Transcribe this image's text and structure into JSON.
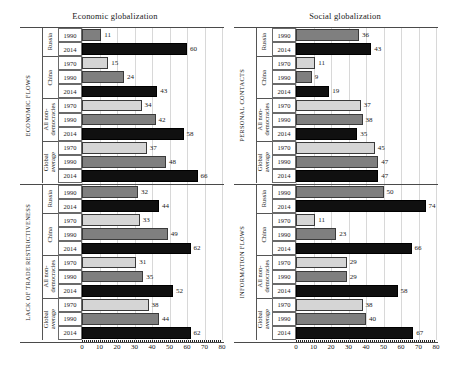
{
  "figure": {
    "width": 460,
    "height": 369,
    "colors": {
      "series_1970": "#d5d5d5",
      "series_1990": "#7f7f7f",
      "series_2014": "#101010",
      "gridline": "#d8d8d8",
      "axis": "#4a4a4a",
      "text": "#1a1a1a"
    }
  },
  "panels": [
    {
      "id": "economic",
      "title": "Economic globalization",
      "axis": {
        "min": 0,
        "max": 80,
        "ticks": [
          "0",
          "10",
          "20",
          "30",
          "40",
          "50",
          "60",
          "70",
          "80"
        ]
      },
      "sections": [
        {
          "label": "ECONOMIC FLOWS",
          "groups": [
            {
              "label": "Russia",
              "rows": [
                {
                  "year": "1990",
                  "series": "s1990",
                  "value": 11
                },
                {
                  "year": "2014",
                  "series": "s2014",
                  "value": 60
                }
              ]
            },
            {
              "label": "China",
              "rows": [
                {
                  "year": "1970",
                  "series": "s1970",
                  "value": 15
                },
                {
                  "year": "1990",
                  "series": "s1990",
                  "value": 24
                },
                {
                  "year": "2014",
                  "series": "s2014",
                  "value": 43
                }
              ]
            },
            {
              "label": "All non-\ndemocracies",
              "rows": [
                {
                  "year": "1970",
                  "series": "s1970",
                  "value": 34
                },
                {
                  "year": "1990",
                  "series": "s1990",
                  "value": 42
                },
                {
                  "year": "2014",
                  "series": "s2014",
                  "value": 58
                }
              ]
            },
            {
              "label": "Global\naverage",
              "rows": [
                {
                  "year": "1970",
                  "series": "s1970",
                  "value": 37
                },
                {
                  "year": "1990",
                  "series": "s1990",
                  "value": 48
                },
                {
                  "year": "2014",
                  "series": "s2014",
                  "value": 66
                }
              ]
            }
          ]
        },
        {
          "label": "LACK OF TRADE RESTRICTIVENESS",
          "groups": [
            {
              "label": "Russia",
              "rows": [
                {
                  "year": "1990",
                  "series": "s1990",
                  "value": 32
                },
                {
                  "year": "2014",
                  "series": "s2014",
                  "value": 44
                }
              ]
            },
            {
              "label": "China",
              "rows": [
                {
                  "year": "1970",
                  "series": "s1970",
                  "value": 33
                },
                {
                  "year": "1990",
                  "series": "s1990",
                  "value": 49
                },
                {
                  "year": "2014",
                  "series": "s2014",
                  "value": 62
                }
              ]
            },
            {
              "label": "All non-\ndemocracies",
              "rows": [
                {
                  "year": "1970",
                  "series": "s1970",
                  "value": 31
                },
                {
                  "year": "1990",
                  "series": "s1990",
                  "value": 35
                },
                {
                  "year": "2014",
                  "series": "s2014",
                  "value": 52
                }
              ]
            },
            {
              "label": "Global\naverage",
              "rows": [
                {
                  "year": "1970",
                  "series": "s1970",
                  "value": 38
                },
                {
                  "year": "1990",
                  "series": "s1990",
                  "value": 44
                },
                {
                  "year": "2014",
                  "series": "s2014",
                  "value": 62
                }
              ]
            }
          ]
        }
      ]
    },
    {
      "id": "social",
      "title": "Social globalization",
      "axis": {
        "min": 0,
        "max": 80,
        "ticks": [
          "0",
          "10",
          "20",
          "30",
          "40",
          "50",
          "60",
          "70",
          "80"
        ]
      },
      "sections": [
        {
          "label": "PERSONAL CONTACTS",
          "groups": [
            {
              "label": "Russia",
              "rows": [
                {
                  "year": "1990",
                  "series": "s1990",
                  "value": 36
                },
                {
                  "year": "2014",
                  "series": "s2014",
                  "value": 43
                }
              ]
            },
            {
              "label": "China",
              "rows": [
                {
                  "year": "1970",
                  "series": "s1970",
                  "value": 11
                },
                {
                  "year": "1990",
                  "series": "s1990",
                  "value": 9
                },
                {
                  "year": "2014",
                  "series": "s2014",
                  "value": 19
                }
              ]
            },
            {
              "label": "All non-\ndemocracies",
              "rows": [
                {
                  "year": "1970",
                  "series": "s1970",
                  "value": 37
                },
                {
                  "year": "1990",
                  "series": "s1990",
                  "value": 38
                },
                {
                  "year": "2014",
                  "series": "s2014",
                  "value": 35
                }
              ]
            },
            {
              "label": "Global\naverage",
              "rows": [
                {
                  "year": "1970",
                  "series": "s1970",
                  "value": 45
                },
                {
                  "year": "1990",
                  "series": "s1990",
                  "value": 47
                },
                {
                  "year": "2014",
                  "series": "s2014",
                  "value": 47
                }
              ]
            }
          ]
        },
        {
          "label": "INFORMATION FLOWS",
          "groups": [
            {
              "label": "Russia",
              "rows": [
                {
                  "year": "1990",
                  "series": "s1990",
                  "value": 50
                },
                {
                  "year": "2014",
                  "series": "s2014",
                  "value": 74
                }
              ]
            },
            {
              "label": "China",
              "rows": [
                {
                  "year": "1970",
                  "series": "s1970",
                  "value": 11
                },
                {
                  "year": "1990",
                  "series": "s1990",
                  "value": 23
                },
                {
                  "year": "2014",
                  "series": "s2014",
                  "value": 66
                }
              ]
            },
            {
              "label": "All non-\ndemocracies",
              "rows": [
                {
                  "year": "1970",
                  "series": "s1970",
                  "value": 29
                },
                {
                  "year": "1990",
                  "series": "s1990",
                  "value": 29
                },
                {
                  "year": "2014",
                  "series": "s2014",
                  "value": 58
                }
              ]
            },
            {
              "label": "Global\naverage",
              "rows": [
                {
                  "year": "1970",
                  "series": "s1970",
                  "value": 38
                },
                {
                  "year": "1990",
                  "series": "s1990",
                  "value": 40
                },
                {
                  "year": "2014",
                  "series": "s2014",
                  "value": 67
                }
              ]
            }
          ]
        }
      ]
    }
  ],
  "chart_data": {
    "type": "bar",
    "orientation": "horizontal",
    "xlabel": "",
    "ylabel": "",
    "xlim": [
      0,
      80
    ],
    "xticks": [
      0,
      10,
      20,
      30,
      40,
      50,
      60,
      70,
      80
    ],
    "grid": true,
    "legend": null,
    "series": [
      {
        "name": "1970",
        "color": "#d5d5d5"
      },
      {
        "name": "1990",
        "color": "#7f7f7f"
      },
      {
        "name": "2014",
        "color": "#101010"
      }
    ],
    "panels": [
      {
        "title": "Economic globalization",
        "dimensions": [
          {
            "name": "ECONOMIC FLOWS",
            "categories": [
              "Russia",
              "China",
              "All non-democracies",
              "Global average"
            ],
            "data": {
              "1970": [
                null,
                15,
                34,
                37
              ],
              "1990": [
                11,
                24,
                42,
                48
              ],
              "2014": [
                60,
                43,
                58,
                66
              ]
            }
          },
          {
            "name": "LACK OF TRADE RESTRICTIVENESS",
            "categories": [
              "Russia",
              "China",
              "All non-democracies",
              "Global average"
            ],
            "data": {
              "1970": [
                null,
                33,
                31,
                38
              ],
              "1990": [
                32,
                49,
                35,
                44
              ],
              "2014": [
                44,
                62,
                52,
                62
              ]
            }
          }
        ]
      },
      {
        "title": "Social globalization",
        "dimensions": [
          {
            "name": "PERSONAL CONTACTS",
            "categories": [
              "Russia",
              "China",
              "All non-democracies",
              "Global average"
            ],
            "data": {
              "1970": [
                null,
                11,
                37,
                45
              ],
              "1990": [
                36,
                9,
                38,
                47
              ],
              "2014": [
                43,
                19,
                35,
                47
              ]
            }
          },
          {
            "name": "INFORMATION FLOWS",
            "categories": [
              "Russia",
              "China",
              "All non-democracies",
              "Global average"
            ],
            "data": {
              "1970": [
                null,
                11,
                29,
                38
              ],
              "1990": [
                50,
                23,
                29,
                40
              ],
              "2014": [
                74,
                66,
                58,
                67
              ]
            }
          }
        ]
      }
    ]
  }
}
